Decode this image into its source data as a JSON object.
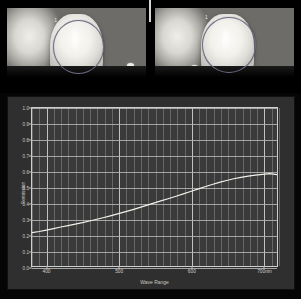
{
  "figure": {
    "panels": {
      "left_photo": {
        "name": "tooth-photo-left",
        "roi_label": "1",
        "description": "clinical photograph of central incisor with elliptical measurement region"
      },
      "right_photo": {
        "name": "tooth-photo-right",
        "roi_label": "1",
        "description": "clinical photograph of central incisor with elliptical measurement region"
      }
    }
  },
  "chart_data": {
    "type": "line",
    "title": "",
    "xlabel": "Wave Range",
    "ylabel": "Remission",
    "xlim": [
      380,
      720
    ],
    "ylim": [
      0.0,
      1.0
    ],
    "grid": true,
    "legend": "none",
    "x_tick_labels": [
      "400",
      "500",
      "600",
      "700nm"
    ],
    "x_ticks": [
      400,
      500,
      600,
      700
    ],
    "y_tick_labels": [
      "0.0",
      "0.1",
      "0.2",
      "0.3",
      "0.4",
      "0.5",
      "0.6",
      "0.7",
      "0.8",
      "0.9",
      "1.0"
    ],
    "y_ticks": [
      0.0,
      0.1,
      0.2,
      0.3,
      0.4,
      0.5,
      0.6,
      0.7,
      0.8,
      0.9,
      1.0
    ],
    "minor_x_step": 10,
    "series": [
      {
        "name": "Remission spectrum",
        "color": "#f3f1ea",
        "x": [
          380,
          390,
          400,
          410,
          420,
          430,
          440,
          450,
          460,
          470,
          480,
          490,
          500,
          510,
          520,
          530,
          540,
          550,
          560,
          570,
          580,
          590,
          600,
          610,
          620,
          630,
          640,
          650,
          660,
          670,
          680,
          690,
          700,
          710,
          720
        ],
        "y": [
          0.215,
          0.222,
          0.231,
          0.24,
          0.25,
          0.259,
          0.268,
          0.278,
          0.288,
          0.299,
          0.31,
          0.322,
          0.334,
          0.347,
          0.36,
          0.374,
          0.388,
          0.402,
          0.416,
          0.43,
          0.444,
          0.459,
          0.474,
          0.489,
          0.504,
          0.518,
          0.531,
          0.543,
          0.554,
          0.563,
          0.571,
          0.577,
          0.582,
          0.586,
          0.58
        ]
      }
    ]
  },
  "colors": {
    "plot_background": "#3a3a3a",
    "frame_background": "#2f2f2f",
    "grid": "#b9b9b9",
    "curve": "#f3f1ea",
    "page_background": "#000000",
    "roi_outline": "#6e6c86"
  }
}
